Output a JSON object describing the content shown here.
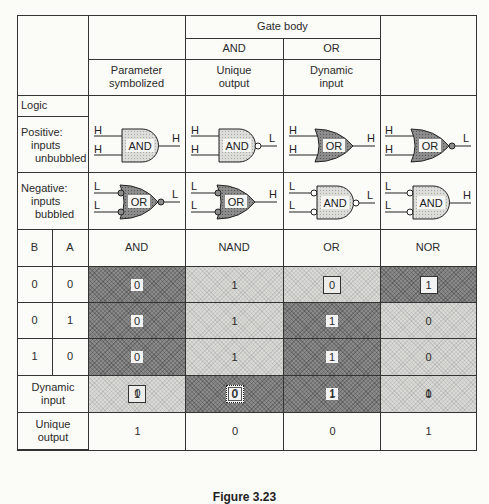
{
  "header": {
    "gate_body": "Gate body",
    "and": "AND",
    "or": "OR",
    "parameter_symbolized": "Parameter symbolized",
    "unique_output": "Unique output",
    "dynamic_input": "Dynamic input",
    "logic": "Logic",
    "positive": "Positive:",
    "positive_sub1": "inputs",
    "positive_sub2": "unbubbled",
    "negative": "Negative:",
    "negative_sub1": "inputs",
    "negative_sub2": "bubbled"
  },
  "gates": {
    "positive": [
      {
        "body": "AND",
        "in": [
          "H",
          "H"
        ],
        "out": "H",
        "in_bubbles": false,
        "out_bubble": false,
        "shade": "light"
      },
      {
        "body": "AND",
        "in": [
          "H",
          "H"
        ],
        "out": "L",
        "in_bubbles": false,
        "out_bubble": true,
        "shade": "light"
      },
      {
        "body": "OR",
        "in": [
          "H",
          "H"
        ],
        "out": "H",
        "in_bubbles": false,
        "out_bubble": false,
        "shade": "dark"
      },
      {
        "body": "OR",
        "in": [
          "H",
          "H"
        ],
        "out": "L",
        "in_bubbles": false,
        "out_bubble": true,
        "shade": "dark"
      }
    ],
    "negative": [
      {
        "body": "OR",
        "in": [
          "L",
          "L"
        ],
        "out": "L",
        "in_bubbles": true,
        "out_bubble": true,
        "shade": "dark"
      },
      {
        "body": "OR",
        "in": [
          "L",
          "L"
        ],
        "out": "H",
        "in_bubbles": true,
        "out_bubble": false,
        "shade": "dark"
      },
      {
        "body": "AND",
        "in": [
          "L",
          "L"
        ],
        "out": "L",
        "in_bubbles": true,
        "out_bubble": true,
        "shade": "light"
      },
      {
        "body": "AND",
        "in": [
          "L",
          "L"
        ],
        "out": "H",
        "in_bubbles": true,
        "out_bubble": false,
        "shade": "light"
      }
    ]
  },
  "truth_table": {
    "col_b": "B",
    "col_a": "A",
    "functions": [
      "AND",
      "NAND",
      "OR",
      "NOR"
    ],
    "rows": [
      {
        "b": "0",
        "a": "0",
        "values": [
          "0",
          "1",
          "0",
          "1"
        ],
        "shades": [
          "dark",
          "light",
          "light",
          "dark"
        ],
        "marks": [
          "",
          "",
          "box",
          "box"
        ]
      },
      {
        "b": "0",
        "a": "1",
        "values": [
          "0",
          "1",
          "1",
          "0"
        ],
        "shades": [
          "dark",
          "light",
          "dark",
          "light"
        ],
        "marks": [
          "",
          "",
          "",
          ""
        ]
      },
      {
        "b": "1",
        "a": "0",
        "values": [
          "0",
          "1",
          "1",
          "0"
        ],
        "shades": [
          "dark",
          "light",
          "dark",
          "light"
        ],
        "marks": [
          "",
          "",
          "",
          ""
        ]
      },
      {
        "b": "1",
        "a": "1",
        "values": [
          "1",
          "0",
          "1",
          "0"
        ],
        "shades": [
          "light",
          "dark",
          "dark",
          "light"
        ],
        "marks": [
          "box",
          "dotbox",
          "",
          ""
        ]
      }
    ]
  },
  "footer_rows": {
    "dynamic_input_label": "Dynamic input",
    "dynamic_input_values": [
      "0",
      "0",
      "1",
      "1"
    ],
    "unique_output_label": "Unique output",
    "unique_output_values": [
      "1",
      "0",
      "0",
      "1"
    ]
  },
  "caption": "Figure 3.23"
}
